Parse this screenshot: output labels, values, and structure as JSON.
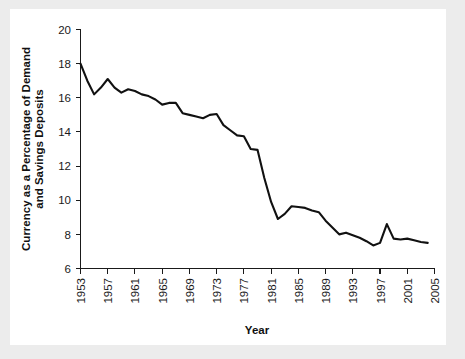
{
  "figure": {
    "background_color": "#ececec",
    "panel_color": "#ffffff",
    "line_color": "#111111"
  },
  "chart_data": {
    "type": "line",
    "title": "",
    "xlabel": "Year",
    "ylabel": "Currency as a Percentage of Demand and Savings Deposits",
    "ylabel_line1": "Currency as a Percentage of Demand",
    "ylabel_line2": "and Savings Deposits",
    "xlim": [
      1953,
      2005
    ],
    "ylim": [
      6,
      20
    ],
    "grid": false,
    "legend": "none",
    "xticks": [
      1953,
      1957,
      1961,
      1965,
      1969,
      1973,
      1977,
      1981,
      1985,
      1989,
      1993,
      1997,
      2001,
      2005
    ],
    "xticklabels": [
      "1953",
      "1957",
      "1961",
      "1965",
      "1969",
      "1973",
      "1977",
      "1981",
      "1985",
      "1989",
      "1993",
      "1997",
      "2001",
      "2005"
    ],
    "yticks": [
      6,
      8,
      10,
      12,
      14,
      16,
      18,
      20
    ],
    "yticklabels": [
      "6",
      "8",
      "10",
      "12",
      "14",
      "16",
      "18",
      "20"
    ],
    "series": [
      {
        "name": "Currency as a Percentage of Demand and Savings Deposits",
        "x": [
          1953,
          1954,
          1955,
          1956,
          1957,
          1958,
          1959,
          1960,
          1961,
          1962,
          1963,
          1964,
          1965,
          1966,
          1967,
          1968,
          1969,
          1970,
          1971,
          1972,
          1973,
          1974,
          1975,
          1976,
          1977,
          1978,
          1979,
          1980,
          1981,
          1982,
          1983,
          1984,
          1985,
          1986,
          1987,
          1988,
          1989,
          1990,
          1991,
          1992,
          1993,
          1994,
          1995,
          1996,
          1997,
          1998,
          1999,
          2000,
          2001,
          2002,
          2003,
          2004
        ],
        "y": [
          18.0,
          17.0,
          16.2,
          16.6,
          17.1,
          16.6,
          16.3,
          16.5,
          16.4,
          16.2,
          16.1,
          15.9,
          15.6,
          15.7,
          15.7,
          15.1,
          15.0,
          14.9,
          14.8,
          15.0,
          15.05,
          14.4,
          14.1,
          13.8,
          13.75,
          13.0,
          12.95,
          11.3,
          9.9,
          8.9,
          9.2,
          9.65,
          9.6,
          9.55,
          9.4,
          9.3,
          8.8,
          8.4,
          8.0,
          8.1,
          7.95,
          7.8,
          7.6,
          7.35,
          7.5,
          8.6,
          7.75,
          7.7,
          7.75,
          7.65,
          7.55,
          7.5
        ]
      }
    ]
  }
}
